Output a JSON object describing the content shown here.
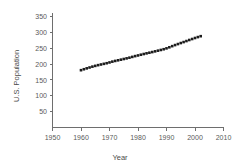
{
  "chart_data": {
    "type": "scatter",
    "title": "",
    "xlabel": "Year",
    "ylabel": "U.S. Population",
    "xlim": [
      1950,
      2010
    ],
    "ylim": [
      0,
      350
    ],
    "xticks": [
      1950,
      1960,
      1970,
      1980,
      1990,
      2000,
      2010
    ],
    "xtick_labels": [
      "1950",
      "1960",
      "1970",
      "1980",
      "1990",
      "2000",
      "2010"
    ],
    "yticks": [
      50,
      100,
      150,
      200,
      250,
      300,
      350
    ],
    "ytick_labels": [
      "50",
      "100",
      "150",
      "200",
      "250",
      "300",
      "350"
    ],
    "grid": false,
    "legend": null,
    "marker_color": "#1c1c1c",
    "axis_color": "#6e6e6e",
    "background_color": "#ffffff",
    "x": [
      1960,
      1961,
      1962,
      1963,
      1964,
      1965,
      1966,
      1967,
      1968,
      1969,
      1970,
      1971,
      1972,
      1973,
      1974,
      1975,
      1976,
      1977,
      1978,
      1979,
      1980,
      1981,
      1982,
      1983,
      1984,
      1985,
      1986,
      1987,
      1988,
      1989,
      1990,
      1991,
      1992,
      1993,
      1994,
      1995,
      1996,
      1997,
      1998,
      1999,
      2000,
      2001,
      2002
    ],
    "values": [
      180.7,
      183.7,
      186.5,
      189.2,
      191.9,
      194.3,
      196.6,
      198.7,
      200.7,
      202.7,
      205.1,
      207.7,
      209.9,
      211.9,
      213.9,
      216.0,
      218.0,
      220.2,
      222.6,
      225.1,
      227.2,
      229.5,
      231.7,
      233.8,
      235.8,
      237.9,
      240.1,
      242.3,
      244.5,
      246.8,
      249.6,
      252.9,
      256.5,
      259.9,
      263.1,
      266.3,
      269.4,
      272.6,
      275.9,
      279.0,
      282.2,
      285.1,
      287.9
    ],
    "series_name": "U.S. Population"
  },
  "axis_labels": {
    "x_title": "Year",
    "y_title": "U.S. Population"
  }
}
